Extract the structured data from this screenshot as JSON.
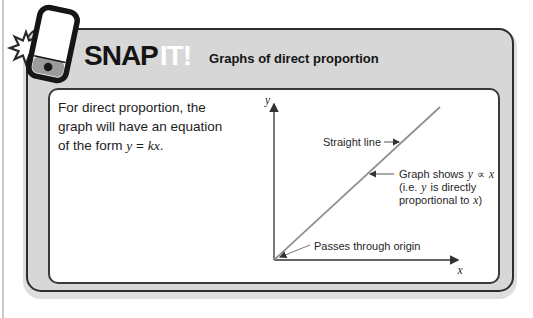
{
  "header": {
    "logo_snap": "SNAP",
    "logo_it": "IT!",
    "title": "Graphs of direct proportion"
  },
  "content": {
    "line1": "For direct proportion, the",
    "line2": "graph will have an equation",
    "line3_prefix": "of the form",
    "line3_y": "y",
    "line3_eq": "=",
    "line3_kx": "kx",
    "line3_period": "."
  },
  "graph": {
    "y_axis_label": "y",
    "x_axis_label": "x",
    "callout_straight_line": "Straight line",
    "callout_shows_prefix": "Graph shows",
    "callout_shows_y": "y",
    "callout_shows_propto": "∝",
    "callout_shows_x": "x",
    "callout_ie_prefix": "(i.e.",
    "callout_ie_y": "y",
    "callout_ie_rest": "is directly",
    "callout_prop_prefix": "proportional to",
    "callout_prop_x": "x",
    "callout_prop_paren": ")",
    "callout_origin": "Passes through origin"
  },
  "colors": {
    "box_fill": "#d7d7d7",
    "box_border": "#2d2d2d",
    "box_shadow": "#dedede",
    "inner_fill": "#ffffff",
    "inner_border": "#3a3a3a",
    "graph_line_gray": "#8f8f8f",
    "axis_color": "#333333",
    "text_color": "#1c1c1c"
  }
}
